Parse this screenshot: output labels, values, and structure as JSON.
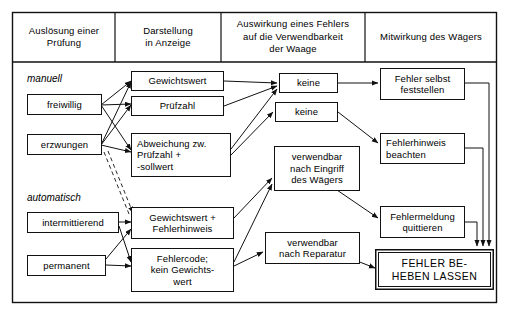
{
  "diagram": {
    "columns": [
      {
        "id": "col-ausloesung",
        "header": "Auslösung einer\nPrüfung"
      },
      {
        "id": "col-darstellung",
        "header": "Darstellung\nin Anzeige"
      },
      {
        "id": "col-auswirkung",
        "header": "Auswirkung eines Fehlers\nauf die Verwendbarkeit\nder Waage"
      },
      {
        "id": "col-mitwirkung",
        "header": "Mitwirkung des Wägers"
      }
    ],
    "group_labels": [
      {
        "id": "group-manuell",
        "text": "manuell"
      },
      {
        "id": "group-automatisch",
        "text": "automatisch"
      }
    ],
    "nodes": [
      {
        "id": "freiwillig",
        "label": "freiwillig"
      },
      {
        "id": "erzwungen",
        "label": "erzwungen"
      },
      {
        "id": "intermittierend",
        "label": "intermittierend"
      },
      {
        "id": "permanent",
        "label": "permanent"
      },
      {
        "id": "gewichtswert",
        "label": "Gewichtswert"
      },
      {
        "id": "pruefzahl",
        "label": "Prüfzahl"
      },
      {
        "id": "abweichung",
        "label": "Abweichung zw.\nPrüfzahl +\n-sollwert"
      },
      {
        "id": "gewichtswert-fehlerhinweis",
        "label": "Gewichtswert +\nFehlerhinweis"
      },
      {
        "id": "fehlercode",
        "label": "Fehlercode;\nkein Gewichts-\nwert"
      },
      {
        "id": "keine-1",
        "label": "keine"
      },
      {
        "id": "keine-2",
        "label": "keine"
      },
      {
        "id": "verwendbar-eingriff",
        "label": "verwendbar\nnach Eingriff\ndes Wägers"
      },
      {
        "id": "verwendbar-reparatur",
        "label": "verwendbar\nnach Reparatur"
      },
      {
        "id": "fehler-selbst",
        "label": "Fehler selbst\nfeststellen"
      },
      {
        "id": "fehlerhinweis-beachten",
        "label": "Fehlerhinweis\nbeachten"
      },
      {
        "id": "fehlermeldung-quittieren",
        "label": "Fehlermeldung\nquittieren"
      },
      {
        "id": "fehler-beheben",
        "label": "FEHLER BE-\nHEBEN LASSEN"
      }
    ],
    "colors": {
      "line": "#111111",
      "background": "#ffffff",
      "text": "#000000"
    }
  }
}
